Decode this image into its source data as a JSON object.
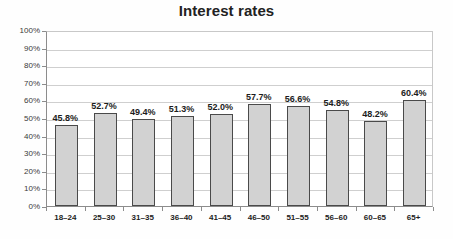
{
  "chart_data": {
    "type": "bar",
    "title": "Interest rates",
    "xlabel": "",
    "ylabel": "",
    "categories": [
      "18–24",
      "25–30",
      "31–35",
      "36–40",
      "41–45",
      "46–50",
      "51–55",
      "56–60",
      "60–65",
      "65+"
    ],
    "values": [
      45.8,
      52.7,
      49.4,
      51.3,
      52.0,
      57.7,
      56.6,
      54.8,
      48.2,
      60.4
    ],
    "data_labels": [
      "45.8%",
      "52.7%",
      "49.4%",
      "51.3%",
      "52.0%",
      "57.7%",
      "56.6%",
      "54.8%",
      "48.2%",
      "60.4%"
    ],
    "ylim": [
      0,
      100
    ],
    "ytick_values": [
      0,
      10,
      20,
      30,
      40,
      50,
      60,
      70,
      80,
      90,
      100
    ],
    "ytick_labels": [
      "0%",
      "10%",
      "20%",
      "30%",
      "40%",
      "50%",
      "60%",
      "70%",
      "80%",
      "90%",
      "100%"
    ],
    "grid": true,
    "legend": false,
    "legend_position": "none",
    "colors": {
      "bar_fill": "#d2d2d2",
      "bar_border": "#4a4a4a",
      "gridline": "#cfcfcf",
      "axis": "#8c8c8c",
      "title_text": "#222222",
      "label_text": "#1c1c1c",
      "background": "#fefefe"
    }
  }
}
